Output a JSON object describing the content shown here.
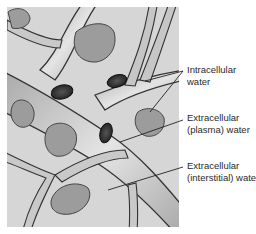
{
  "figure": {
    "type": "illustration"
  },
  "labels": [
    {
      "id": "intracellular",
      "lines": [
        "Intracellular",
        "water"
      ]
    },
    {
      "id": "plasma",
      "lines": [
        "Extracellular",
        "(plasma) water"
      ]
    },
    {
      "id": "interstitial",
      "lines": [
        "Extracellular",
        "(interstitial) water"
      ]
    }
  ],
  "colors": {
    "background": "#ffffff",
    "tissue": "#d9d9d9",
    "vessel": "#bdbdbd",
    "vessel_highlight": "#e6e6e6",
    "outline": "#333333",
    "cell": "#9a9a9a",
    "red_cell": "#2e2e2e",
    "text": "#2a2a2a"
  }
}
